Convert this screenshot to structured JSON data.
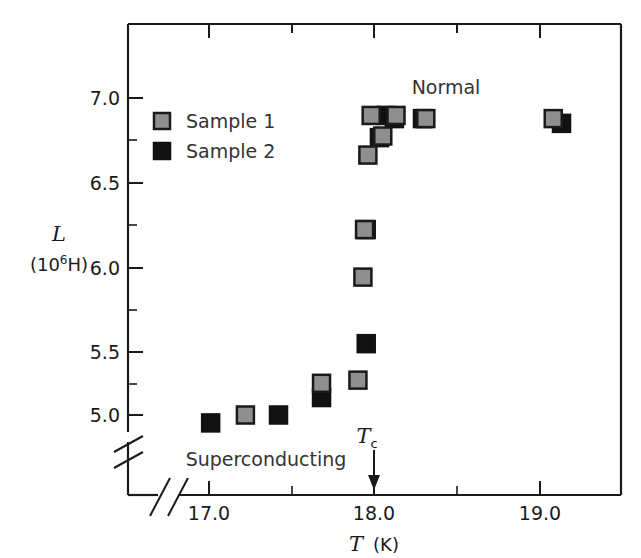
{
  "figure": {
    "background": "#ffffff",
    "frame_color": "#1a1a1a"
  },
  "chart_data": {
    "type": "scatter",
    "title": "",
    "xlabel": "T  (K)",
    "xlabel_symbol": "T",
    "xlabel_unit": "(K)",
    "ylabel": "L",
    "ylabel_unit_prefix": "(10",
    "ylabel_unit_exp": "6",
    "ylabel_unit_suffix": "H)",
    "xlim": [
      16.78,
      19.28
    ],
    "ylim": [
      4.78,
      7.25
    ],
    "xticks": [
      17.0,
      18.0,
      19.0
    ],
    "xticklabels": [
      "17.0",
      "18.0",
      "19.0"
    ],
    "xminorticks": [
      17.5,
      18.5
    ],
    "yticks": [
      5.0,
      5.5,
      6.0,
      6.5,
      7.0
    ],
    "yticklabels": [
      "5.0",
      "5.5",
      "6.0",
      "6.5",
      "7.0"
    ],
    "yminorticks": [
      5.25,
      5.75,
      6.25,
      6.75
    ],
    "grid": false,
    "axis_break_x": true,
    "axis_break_y": true,
    "legend_position": "upper-left-inside",
    "series": [
      {
        "name": "Sample 1",
        "marker": "square",
        "color": "#8f8f8f",
        "edgecolor": "#1a1a1a",
        "points": [
          {
            "x": 17.22,
            "y": 5.0
          },
          {
            "x": 17.68,
            "y": 5.2
          },
          {
            "x": 17.9,
            "y": 5.22
          },
          {
            "x": 17.93,
            "y": 5.87
          },
          {
            "x": 17.94,
            "y": 6.17
          },
          {
            "x": 17.96,
            "y": 6.64
          },
          {
            "x": 17.98,
            "y": 6.89
          },
          {
            "x": 18.05,
            "y": 6.76
          },
          {
            "x": 18.13,
            "y": 6.89
          },
          {
            "x": 18.31,
            "y": 6.87
          },
          {
            "x": 19.08,
            "y": 6.87
          }
        ]
      },
      {
        "name": "Sample 2",
        "marker": "square",
        "color": "#111111",
        "edgecolor": "#111111",
        "points": [
          {
            "x": 17.01,
            "y": 4.95
          },
          {
            "x": 17.42,
            "y": 5.0
          },
          {
            "x": 17.68,
            "y": 5.11
          },
          {
            "x": 17.95,
            "y": 5.45
          },
          {
            "x": 17.95,
            "y": 6.17
          },
          {
            "x": 18.03,
            "y": 6.75
          },
          {
            "x": 18.07,
            "y": 6.89
          },
          {
            "x": 18.12,
            "y": 6.87
          },
          {
            "x": 18.29,
            "y": 6.87
          },
          {
            "x": 19.13,
            "y": 6.84
          }
        ]
      }
    ],
    "annotations": [
      {
        "name": "normal-region-label",
        "text": "Normal",
        "x": 18.45,
        "y": 7.09
      },
      {
        "name": "superconducting-region-label",
        "text": "Superconducting",
        "x": 17.45,
        "y": 4.85
      },
      {
        "name": "critical-temperature-marker",
        "text": "T",
        "subscript": "c",
        "x": 18.0,
        "y": 4.93,
        "arrow": true
      }
    ]
  },
  "legend": {
    "entries": [
      {
        "label": "Sample 1",
        "swatch": "#8f8f8f"
      },
      {
        "label": "Sample 2",
        "swatch": "#111111"
      }
    ]
  }
}
